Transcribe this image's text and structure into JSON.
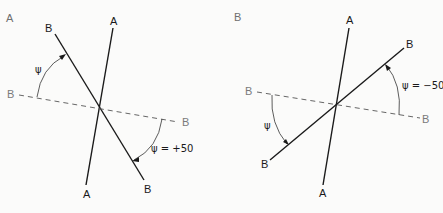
{
  "panels": [
    {
      "id": "A",
      "panel_label": "A",
      "labels": {
        "a_top": "A",
        "a_bottom": "A",
        "b_solid_top": "B",
        "b_solid_bottom": "B",
        "b_dashed_left": "B",
        "b_dashed_right": "B",
        "psi_upper": "ψ",
        "psi_lower": "ψ = +50"
      }
    },
    {
      "id": "B",
      "panel_label": "B",
      "labels": {
        "a_top": "A",
        "a_bottom": "A",
        "b_solid_top": "B",
        "b_solid_bottom": "B",
        "b_dashed_left": "B",
        "b_dashed_right": "B",
        "psi_upper": "ψ = −50",
        "psi_lower": "ψ"
      }
    }
  ],
  "colors": {
    "line": "#1a1a1a",
    "dashed": "#555555",
    "gray_label": "#7a7a7a",
    "background": "#fbfbfa"
  }
}
